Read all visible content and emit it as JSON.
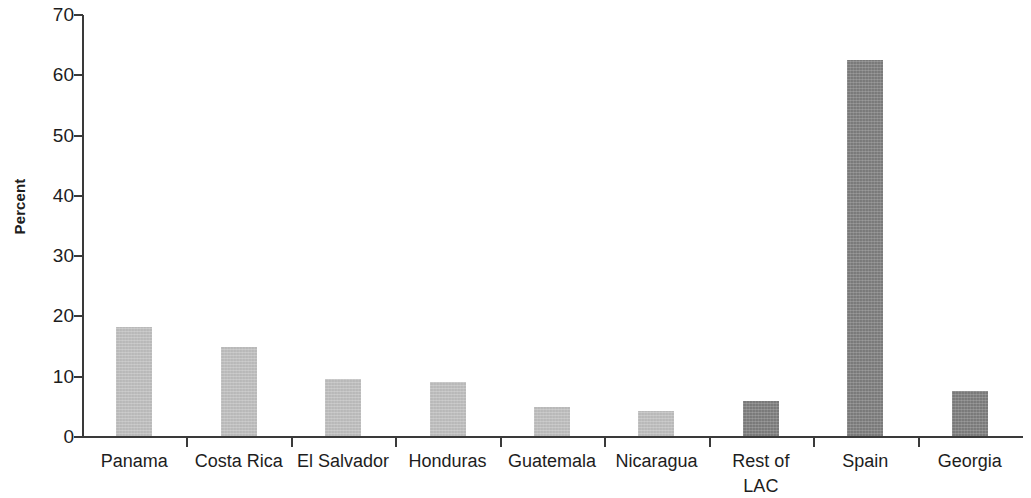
{
  "chart_data": {
    "type": "bar",
    "title": "",
    "subtitle": "",
    "xlabel": "",
    "ylabel": "Percent",
    "ylim": [
      0,
      70
    ],
    "ytick_step": 10,
    "yticks": [
      70,
      60,
      50,
      40,
      30,
      20,
      10,
      0
    ],
    "ytick_labels": [
      "70",
      "60",
      "50",
      "40",
      "30",
      "20",
      "10",
      "0"
    ],
    "grid": false,
    "legend": null,
    "categories": [
      "Panama",
      "Costa Rica",
      "El Salvador",
      "Honduras",
      "Guatemala",
      "Nicaragua",
      "Rest of\nLAC",
      "Spain",
      "Georgia"
    ],
    "values": [
      18.2,
      15.0,
      9.6,
      9.1,
      5.0,
      4.3,
      6.0,
      62.5,
      7.6
    ],
    "bar_colors": [
      "#c2c2c2",
      "#c2c2c2",
      "#c2c2c2",
      "#c2c2c2",
      "#c2c2c2",
      "#c2c2c2",
      "#808080",
      "#808080",
      "#808080"
    ],
    "colors": {
      "light_bar": "#c2c2c2",
      "dark_bar": "#808080",
      "axis": "#3a3a3a",
      "text": "#1d1d1d",
      "background": "#ffffff"
    }
  }
}
